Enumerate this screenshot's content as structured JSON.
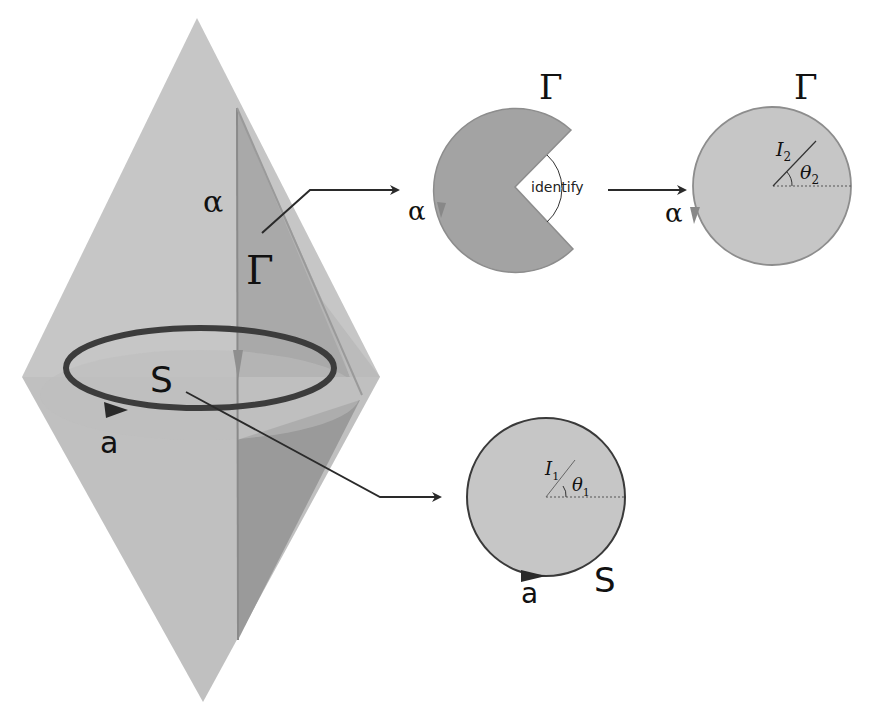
{
  "diagram": {
    "type": "topology-diagram",
    "colors": {
      "cone_light": "#c4c4c4",
      "cone_dark": "#9c9c9c",
      "sector_fill": "#a3a3a3",
      "disc_fill": "#c6c6c6",
      "loop_stroke": "#3c3c3c",
      "arrow": "#2a2a2a",
      "text": "#111111"
    },
    "cone": {
      "labels": {
        "alpha": "α",
        "gamma": "Γ",
        "loop": "S",
        "orientation": "a"
      }
    },
    "sector": {
      "labels": {
        "gamma": "Γ",
        "alpha": "α",
        "identify": "identify"
      }
    },
    "disc_top": {
      "labels": {
        "gamma": "Γ",
        "alpha": "α",
        "I": "I",
        "I_sub": "2",
        "theta": "θ",
        "theta_sub": "2"
      }
    },
    "disc_bottom": {
      "labels": {
        "S": "S",
        "a": "a",
        "I": "I",
        "I_sub": "1",
        "theta": "θ",
        "theta_sub": "1"
      }
    },
    "edges": [
      {
        "from": "cone-gamma",
        "to": "sector"
      },
      {
        "from": "sector",
        "to": "disc-top",
        "label": "identify"
      },
      {
        "from": "cone-loop-S",
        "to": "disc-bottom"
      }
    ]
  }
}
